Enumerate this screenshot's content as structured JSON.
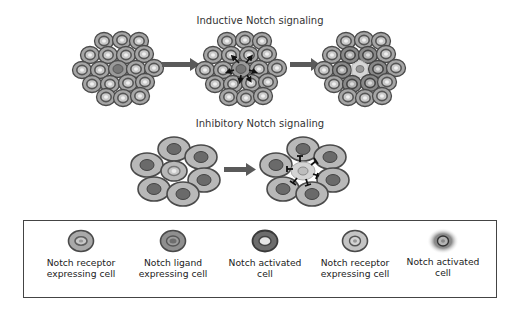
{
  "titles": {
    "inductive": "Inductive Notch signaling",
    "inhibitory": "Inhibitory Notch signaling"
  },
  "colors": {
    "cell_outline": "#4a4a4a",
    "receptor_body": "#a9a9a9",
    "receptor_ring": "#5e5e5e",
    "receptor_nucleus": "#c9c9c9",
    "ligand_body": "#8f8f8f",
    "ligand_nucleus": "#6e6e6e",
    "activated_body": "#6d6d6d",
    "activated_nucleus": "#e6e6e6",
    "light_receptor_body": "#c4c4c4",
    "glow": "#7a7a7a",
    "arrow": "#5a5a5a",
    "signal_mark": "#111111"
  },
  "legend": {
    "items": [
      {
        "icon": "notch-receptor-cell-icon",
        "line1": "Notch receptor",
        "line2": "expressing cell"
      },
      {
        "icon": "notch-ligand-cell-icon",
        "line1": "Notch ligand",
        "line2": "expressing cell"
      },
      {
        "icon": "notch-activated-cell-icon",
        "line1": "Notch activated",
        "line2": "cell"
      },
      {
        "icon": "notch-receptor-cell-light-icon",
        "line1": "Notch receptor",
        "line2": "expressing cell"
      },
      {
        "icon": "notch-activated-glow-cell-icon",
        "line1": "Notch activated",
        "line2": "cell"
      }
    ]
  }
}
